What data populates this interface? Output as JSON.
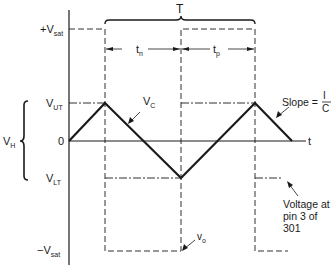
{
  "diagram": {
    "labels": {
      "period": "T",
      "pos_sat": {
        "prefix": "+V",
        "sub": "sat"
      },
      "neg_sat": {
        "prefix": "−V",
        "sub": "sat"
      },
      "upper_threshold": {
        "prefix": "V",
        "sub": "UT"
      },
      "lower_threshold": {
        "prefix": "V",
        "sub": "LT"
      },
      "hysteresis": {
        "prefix": "V",
        "sub": "H"
      },
      "zero": "0",
      "time_axis": "t",
      "t_negative": {
        "prefix": "t",
        "sub": "n"
      },
      "t_positive": {
        "prefix": "t",
        "sub": "p"
      },
      "capacitor_voltage": {
        "prefix": "V",
        "sub": "C"
      },
      "output_voltage": {
        "prefix": "v",
        "sub": "o"
      },
      "slope_text": "Slope =",
      "slope_num": "I",
      "slope_den": "C",
      "pin_note": [
        "Voltage at",
        "pin 3 of",
        "301"
      ]
    },
    "levels": {
      "pos_sat_y": 29,
      "vut_y": 103,
      "zero_y": 141,
      "vlt_y": 178,
      "neg_sat_y": 251
    },
    "transitions_x": [
      105,
      181,
      255
    ],
    "triangle_points": [
      [
        69,
        141
      ],
      [
        105,
        103
      ],
      [
        181,
        178
      ],
      [
        255,
        103
      ],
      [
        292,
        141
      ]
    ],
    "colors": {
      "line": "#1a1a1a",
      "background": "#ffffff"
    }
  }
}
